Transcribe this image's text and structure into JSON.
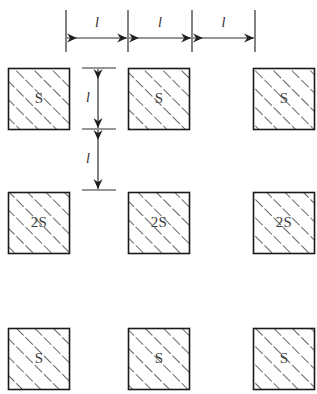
{
  "diagram": {
    "background_color": "#ffffff",
    "outline_color": "#1a1a1a",
    "hatch_color": "#4a4a4a",
    "dimension_color": "#2e2e2e",
    "label_color": "#3b3b3b",
    "blocks": [
      {
        "id": "r1c1",
        "label": "S",
        "x": 8,
        "y": 68,
        "size": 62
      },
      {
        "id": "r1c2",
        "label": "S",
        "x": 128,
        "y": 68,
        "size": 62
      },
      {
        "id": "r1c3",
        "label": "S",
        "x": 253,
        "y": 68,
        "size": 62
      },
      {
        "id": "r2c1",
        "label": "2S",
        "x": 8,
        "y": 192,
        "size": 62
      },
      {
        "id": "r2c2",
        "label": "2S",
        "x": 128,
        "y": 192,
        "size": 62
      },
      {
        "id": "r2c3",
        "label": "2S",
        "x": 253,
        "y": 192,
        "size": 62
      },
      {
        "id": "r3c1",
        "label": "S",
        "x": 8,
        "y": 328,
        "size": 62
      },
      {
        "id": "r3c2",
        "label": "S",
        "x": 128,
        "y": 328,
        "size": 62
      },
      {
        "id": "r3c3",
        "label": "S",
        "x": 253,
        "y": 328,
        "size": 62
      }
    ],
    "horizontal_dimensions": {
      "extension_lines_x": [
        66,
        128,
        192,
        255
      ],
      "extension_top_y": 10,
      "extension_bottom_y": 52,
      "arrow_axis_y": 38,
      "label_y": 24,
      "spans": [
        {
          "id": "h1",
          "label": "l",
          "from_x": 66,
          "to_x": 128
        },
        {
          "id": "h2",
          "label": "l",
          "from_x": 128,
          "to_x": 192
        },
        {
          "id": "h3",
          "label": "l",
          "from_x": 192,
          "to_x": 255
        }
      ]
    },
    "vertical_dimensions": {
      "extension_lines_y": [
        68,
        129,
        190
      ],
      "extension_left_x": 82,
      "extension_right_x": 116,
      "arrow_axis_x": 98,
      "label_x": 88,
      "spans": [
        {
          "id": "v1",
          "label": "l",
          "from_y": 68,
          "to_y": 129
        },
        {
          "id": "v2",
          "label": "l",
          "from_y": 129,
          "to_y": 190
        }
      ]
    }
  },
  "chart_data": {
    "type": "diagram",
    "grid_rows": 3,
    "grid_columns": 3,
    "block_labels": [
      [
        "S",
        "S",
        "S"
      ],
      [
        "2S",
        "2S",
        "2S"
      ],
      [
        "S",
        "S",
        "S"
      ]
    ],
    "block_size_px": 62,
    "horizontal_spacing_labels": [
      "l",
      "l",
      "l"
    ],
    "vertical_spacing_labels": [
      "l",
      "l"
    ]
  }
}
